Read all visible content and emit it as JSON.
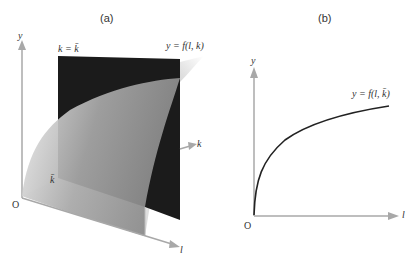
{
  "panel_a": {
    "label": "(a)",
    "axis_y": "y",
    "axis_k": "k",
    "axis_l": "l",
    "origin": "O",
    "plane_label": "k = k̄",
    "surface_label": "y = f(l, k)",
    "kbar_mark": "k̄"
  },
  "panel_b": {
    "label": "(b)",
    "axis_y": "y",
    "axis_l": "l",
    "origin": "O",
    "curve_label": "y = f(l, k̄)"
  },
  "colors": {
    "axis": "#a8a8a8",
    "plane": "#1a1a1a",
    "surface_light": "#e6e6e6",
    "surface_mid": "#9a9a9a",
    "curve": "#222222"
  }
}
